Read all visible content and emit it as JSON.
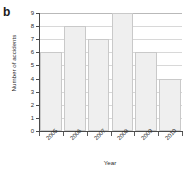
{
  "figure": {
    "panel_label": "b"
  },
  "chart_data": {
    "type": "bar",
    "title": "",
    "subtitle": "",
    "categories": [
      "2005",
      "2006",
      "2007",
      "2008",
      "2009",
      "2010"
    ],
    "values": [
      6,
      8,
      7,
      9,
      6,
      4
    ],
    "series": [
      {
        "name": "Number of accidents",
        "values": [
          6,
          8,
          7,
          9,
          6,
          4
        ]
      }
    ],
    "xlabel": "Year",
    "ylabel": "Number of accidents",
    "ylim": [
      0,
      9
    ],
    "xlim_categories": 6,
    "yticks": [
      0,
      1,
      2,
      3,
      4,
      5,
      6,
      7,
      8,
      9
    ],
    "ytick_labels": [
      "0",
      "1",
      "2",
      "3",
      "4",
      "5",
      "6",
      "7",
      "8",
      "9"
    ],
    "xtick_labels": [
      "2005",
      "2006",
      "2007",
      "2008",
      "2009",
      "2010"
    ],
    "xtick_label_rotation_deg": 45,
    "grid": {
      "horizontal": true,
      "vertical": false
    },
    "legend": {
      "visible": false,
      "position": "none"
    },
    "annotations": [],
    "colors": {
      "bar_fill": "#efefef",
      "bar_edge": "#c9c9c9",
      "gridline": "#d8d8d8",
      "axis": "#4a4a4a",
      "text": "#2b2b2b",
      "background": "#ffffff"
    }
  }
}
